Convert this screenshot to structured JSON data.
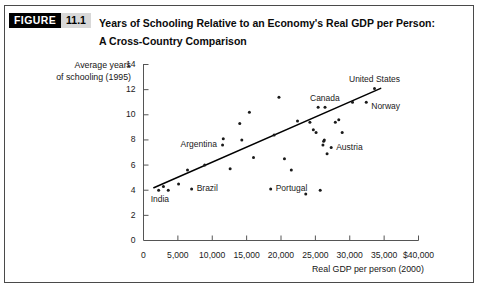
{
  "figure": {
    "tag": "FIGURE",
    "number": "11.1",
    "title_line1": "Years of Schooling Relative to an Economy's Real GDP per Person:",
    "title_line2": "A Cross-Country Comparison"
  },
  "colors": {
    "border": "#4a4a4a",
    "tag_bg": "#000000",
    "tag_fg": "#ffffff",
    "num_bg": "#d8d8d8",
    "axis": "#555555",
    "point": "#1a1a1a",
    "trendline": "#000000"
  },
  "chart_data": {
    "type": "scatter",
    "title": "Years of Schooling Relative to an Economy's Real GDP per Person: A Cross-Country Comparison",
    "xlabel": "Real GDP per person (2000)",
    "ylabel": "Average years of schooling (1995)",
    "ylabel_line1": "Average years",
    "ylabel_line2": "of schooling (1995)",
    "xlim": [
      0,
      40000
    ],
    "ylim": [
      0,
      14
    ],
    "grid": false,
    "legend": "none",
    "xticks": [
      0,
      5000,
      10000,
      15000,
      20000,
      25000,
      30000,
      35000,
      40000
    ],
    "xtick_labels": [
      "0",
      "5,000",
      "10,000",
      "15,000",
      "20,000",
      "25,000",
      "30,000",
      "35,000",
      "$40,000"
    ],
    "yticks": [
      0,
      2,
      4,
      6,
      8,
      10,
      12,
      14
    ],
    "ytick_labels": [
      "0",
      "2",
      "4",
      "6",
      "8",
      "10",
      "12",
      "14"
    ],
    "trendline": {
      "x0": 1500,
      "y0": 4.2,
      "x1": 34500,
      "y1": 12.1
    },
    "points": [
      {
        "x": 2200,
        "y": 4.0,
        "label": "India",
        "label_pos": "below-left"
      },
      {
        "x": 2900,
        "y": 4.3,
        "label": null
      },
      {
        "x": 3600,
        "y": 4.0,
        "label": null
      },
      {
        "x": 5100,
        "y": 4.5,
        "label": null
      },
      {
        "x": 6400,
        "y": 5.6,
        "label": null
      },
      {
        "x": 7000,
        "y": 4.1,
        "label": "Brazil",
        "label_pos": "right"
      },
      {
        "x": 8900,
        "y": 6.0,
        "label": null
      },
      {
        "x": 11500,
        "y": 7.6,
        "label": "Argentina",
        "label_pos": "left"
      },
      {
        "x": 11600,
        "y": 8.1,
        "label": null
      },
      {
        "x": 12600,
        "y": 5.7,
        "label": null
      },
      {
        "x": 14000,
        "y": 9.3,
        "label": null
      },
      {
        "x": 14300,
        "y": 8.0,
        "label": null
      },
      {
        "x": 15400,
        "y": 10.2,
        "label": null
      },
      {
        "x": 16000,
        "y": 6.6,
        "label": null
      },
      {
        "x": 18500,
        "y": 4.1,
        "label": "Portugal",
        "label_pos": "right"
      },
      {
        "x": 19000,
        "y": 8.4,
        "label": null
      },
      {
        "x": 19700,
        "y": 11.4,
        "label": null
      },
      {
        "x": 20500,
        "y": 6.5,
        "label": null
      },
      {
        "x": 21500,
        "y": 5.6,
        "label": null
      },
      {
        "x": 22400,
        "y": 9.5,
        "label": null
      },
      {
        "x": 23600,
        "y": 3.7,
        "label": null
      },
      {
        "x": 24200,
        "y": 9.4,
        "label": null
      },
      {
        "x": 24700,
        "y": 8.8,
        "label": null
      },
      {
        "x": 25100,
        "y": 8.6,
        "label": null
      },
      {
        "x": 25400,
        "y": 10.6,
        "label": null
      },
      {
        "x": 25700,
        "y": 4.0,
        "label": null
      },
      {
        "x": 26100,
        "y": 7.6,
        "label": null
      },
      {
        "x": 26200,
        "y": 7.9,
        "label": null
      },
      {
        "x": 26300,
        "y": 8.0,
        "label": null
      },
      {
        "x": 26400,
        "y": 10.6,
        "label": "Canada",
        "label_pos": "above"
      },
      {
        "x": 26700,
        "y": 6.9,
        "label": null
      },
      {
        "x": 27300,
        "y": 7.4,
        "label": "Austria",
        "label_pos": "right"
      },
      {
        "x": 27900,
        "y": 9.4,
        "label": null
      },
      {
        "x": 28400,
        "y": 9.6,
        "label": null
      },
      {
        "x": 28900,
        "y": 8.6,
        "label": null
      },
      {
        "x": 30400,
        "y": 11.0,
        "label": null
      },
      {
        "x": 32400,
        "y": 11.0,
        "label": "Norway",
        "label_pos": "right-below"
      },
      {
        "x": 33600,
        "y": 12.1,
        "label": "United States",
        "label_pos": "above"
      }
    ]
  }
}
